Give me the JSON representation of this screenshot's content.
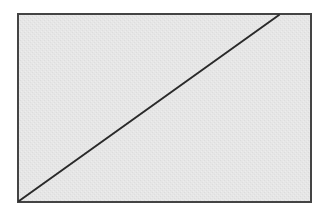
{
  "diagram": {
    "canvas": {
      "width": 329,
      "height": 217,
      "background": "#ffffff"
    },
    "rectangle": {
      "x": 18,
      "y": 14,
      "width": 293,
      "height": 188,
      "fill": "#e6e6e6",
      "stroke": "#444444",
      "stroke_width": 2
    },
    "diagonal": {
      "x1": 19,
      "y1": 201,
      "x2": 279,
      "y2": 15,
      "stroke": "#2a2a2a",
      "stroke_width": 2
    }
  }
}
